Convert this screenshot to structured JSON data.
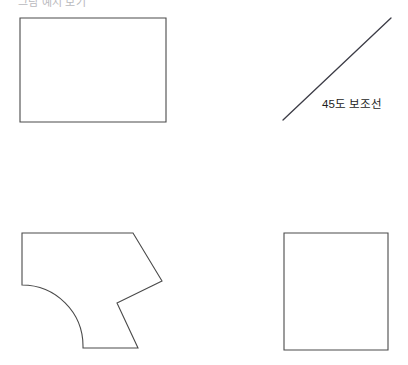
{
  "page": {
    "width": 408,
    "height": 365,
    "background_color": "#ffffff",
    "heading_clipped": "그림 예시 보기"
  },
  "style": {
    "shape_stroke_color": "#4a4a4a",
    "guide_stroke_color": "#3c3c46",
    "label_color": "#1d1d1d"
  },
  "figures": {
    "rectangle": {
      "name": "rectangle",
      "points": "20,18 166,18 166,122 20,122"
    },
    "guide_line": {
      "name": "45-degree-guide-line",
      "x1": 283,
      "y1": 120,
      "x2": 391,
      "y2": 18,
      "label": "45도 보조선",
      "label_x": 322,
      "label_y": 108
    },
    "notched_polygon": {
      "name": "notched-polygon-with-arc",
      "path": "M 22 233 L 133 233 L 162 281 L 117 303 L 138 348 L 83 348 L 83 346 A 61 61 0 0 0 22 285 Z"
    },
    "square": {
      "name": "square",
      "points": "284,233 388,233 388,350 284,350"
    }
  }
}
